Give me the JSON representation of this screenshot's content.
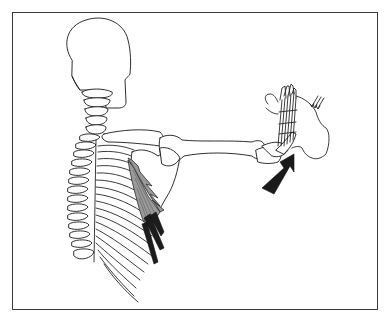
{
  "figure": {
    "subject": "Posterior view of skeleton with right arm extended forward, hand pushing against resistance",
    "highlighted_structure": "serratus anterior muscle (shaded)",
    "colors": {
      "line": "#1a1a1a",
      "muscle_fill": "#9a9a9a",
      "muscle_insertion": "#1c1c1c",
      "arrow": "#1a1a1a",
      "frame": "#3a3a3a",
      "background": "#ffffff"
    },
    "elements": [
      {
        "name": "skull",
        "icon": "skull-outline"
      },
      {
        "name": "cervical-spine",
        "icon": "vertebrae"
      },
      {
        "name": "thoracic-spine",
        "icon": "vertebrae"
      },
      {
        "name": "rib-cage",
        "icon": "ribs"
      },
      {
        "name": "scapula",
        "icon": "scapula"
      },
      {
        "name": "clavicle",
        "icon": "clavicle"
      },
      {
        "name": "humerus-forearm",
        "icon": "arm-bones"
      },
      {
        "name": "hand-bones",
        "icon": "hand-skeleton"
      },
      {
        "name": "resisting-hand",
        "icon": "hand-outline"
      },
      {
        "name": "force-arrow",
        "icon": "large-arrow-up-right"
      },
      {
        "name": "resistance-arrows",
        "icon": "small-arrows-down-left"
      }
    ]
  }
}
